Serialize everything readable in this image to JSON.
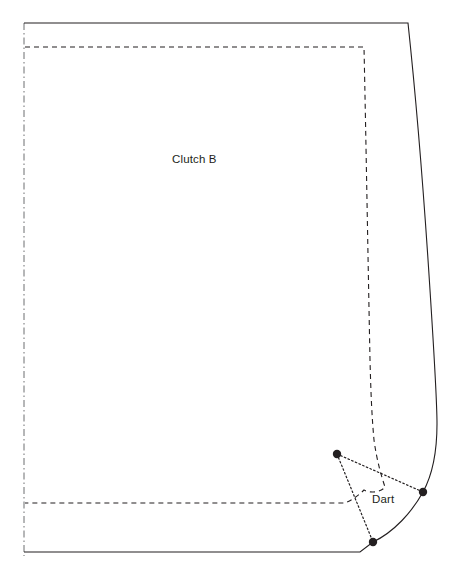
{
  "diagram": {
    "type": "sewing-pattern-piece",
    "title": "Clutch B",
    "background_color": "#ffffff",
    "line_color": "#231f20",
    "labels": {
      "piece_name": "Clutch B",
      "dart": "Dart"
    },
    "lines": {
      "cutting_line": {
        "name": "cutting-line",
        "style": "solid",
        "description": "Outer solid cut edge of the pattern piece",
        "color": "#231f20",
        "width": 1.1
      },
      "stitching_line": {
        "name": "stitching-line",
        "style": "dashed",
        "description": "Inner dashed seam / stitching line",
        "color": "#231f20",
        "width": 1.1,
        "dash": "5,4"
      },
      "fold_line": {
        "name": "fold-line",
        "style": "dash-dot",
        "description": "Left edge place-on-fold line",
        "color": "#6d6e71",
        "width": 1,
        "dash": "7,3,1.5,3"
      },
      "dart_legs": {
        "name": "dart-legs",
        "style": "dotted",
        "description": "Dotted fold legs of the dart",
        "color": "#231f20",
        "width": 1.1,
        "dash": "1.6,2.4"
      }
    },
    "dart_points": [
      {
        "name": "dart-apex-point",
        "x": 337,
        "y": 454
      },
      {
        "name": "dart-upper-leg-point",
        "x": 423,
        "y": 492
      },
      {
        "name": "dart-lower-leg-point",
        "x": 373,
        "y": 542
      }
    ],
    "dot_radius": 4.2
  }
}
